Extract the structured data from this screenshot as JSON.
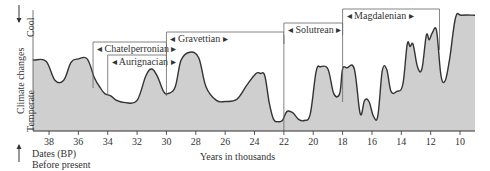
{
  "chart_data": {
    "type": "area",
    "title": "",
    "xlabel": "Years in thousands",
    "xlabel_secondary": [
      "Dates (BP)",
      "Before present"
    ],
    "ylabel": "Climate changes",
    "y_top_label": "Cool",
    "y_bottom_label": "Temperate",
    "x_ticks": [
      38,
      36,
      34,
      32,
      30,
      28,
      26,
      24,
      22,
      20,
      18,
      16,
      14,
      12,
      10
    ],
    "xlim": [
      39,
      9.4
    ],
    "ylim": [
      0,
      1
    ],
    "x_reversed": true,
    "grid": false,
    "fill_color": "#cfcfcf",
    "line_color": "#333333",
    "note": "y = relative coolness (0 = temperate, 1 = cool), estimated from curve height",
    "x": [
      39.0,
      38.2,
      37.6,
      37.0,
      36.5,
      36.0,
      35.4,
      34.9,
      34.5,
      34.2,
      33.8,
      33.4,
      32.8,
      32.0,
      31.4,
      31.0,
      30.6,
      30.2,
      29.9,
      29.4,
      29.0,
      28.4,
      27.8,
      27.3,
      26.6,
      26.0,
      25.2,
      24.5,
      23.9,
      23.6,
      23.3,
      23.0,
      22.7,
      22.4,
      22.1,
      21.8,
      21.4,
      21.0,
      20.6,
      20.2,
      19.8,
      19.5,
      19.0,
      18.6,
      18.2,
      18.0,
      17.7,
      17.2,
      16.8,
      16.5,
      16.2,
      15.9,
      15.6,
      15.3,
      15.0,
      14.7,
      14.3,
      13.9,
      13.6,
      13.4,
      13.2,
      12.9,
      12.6,
      12.3,
      12.1,
      11.9,
      11.6,
      11.3,
      11.0,
      10.7,
      10.3,
      9.9,
      9.4
    ],
    "values": [
      0.58,
      0.57,
      0.4,
      0.4,
      0.56,
      0.59,
      0.59,
      0.42,
      0.33,
      0.28,
      0.26,
      0.22,
      0.2,
      0.22,
      0.44,
      0.5,
      0.43,
      0.3,
      0.28,
      0.34,
      0.58,
      0.65,
      0.6,
      0.34,
      0.22,
      0.21,
      0.23,
      0.36,
      0.46,
      0.46,
      0.44,
      0.2,
      0.05,
      0.03,
      0.04,
      0.12,
      0.11,
      0.05,
      0.04,
      0.1,
      0.48,
      0.52,
      0.5,
      0.28,
      0.28,
      0.5,
      0.51,
      0.5,
      0.1,
      0.22,
      0.21,
      0.08,
      0.08,
      0.48,
      0.5,
      0.3,
      0.3,
      0.36,
      0.72,
      0.7,
      0.72,
      0.52,
      0.5,
      0.8,
      0.76,
      0.82,
      0.84,
      0.44,
      0.4,
      0.6,
      0.96,
      0.98,
      0.98
    ],
    "annotations": [
      {
        "label": "Chatelperronian",
        "start": 35.0,
        "end": 30.0
      },
      {
        "label": "Aurignacian",
        "start": 34.0,
        "end": 30.0
      },
      {
        "label": "Gravettian",
        "start": 30.0,
        "end": 22.0
      },
      {
        "label": "Solutrean",
        "start": 22.0,
        "end": 18.0
      },
      {
        "label": "Magdalenian",
        "start": 18.0,
        "end": 11.4
      }
    ]
  },
  "labels": {
    "ylabel": "Climate changes",
    "cool": "Cool",
    "temperate": "Temperate",
    "xlabel": "Years in thousands",
    "dates_line1": "Dates (BP)",
    "dates_line2": "Before present"
  }
}
